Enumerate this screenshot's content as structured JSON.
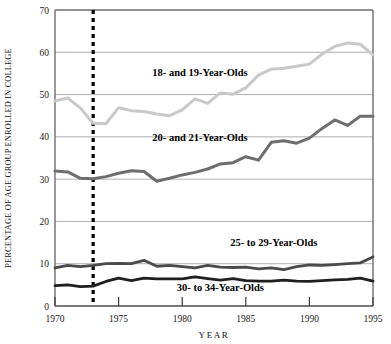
{
  "chart_data": {
    "type": "line",
    "title": "",
    "xlabel": "YEAR",
    "ylabel": "PERCENTAGE OF AGE GROUP ENROLLED IN COLLEGE",
    "xlim": [
      1970,
      1995
    ],
    "ylim": [
      0,
      70
    ],
    "xticks": [
      1970,
      1975,
      1980,
      1985,
      1990,
      1995
    ],
    "xtick_labels": [
      "1970",
      "1975",
      "1980",
      "1985",
      "1990",
      "1995"
    ],
    "yticks": [
      0,
      10,
      20,
      30,
      40,
      50,
      60,
      70
    ],
    "ytick_labels": [
      "0",
      "10",
      "20",
      "30",
      "40",
      "50",
      "60",
      "70"
    ],
    "grid": "horizontal",
    "legend_position": "inline-annotations",
    "annotations": [
      {
        "text": "18- and 19-Year-Olds",
        "x": 1981.4,
        "y": 54.5
      },
      {
        "text": "20- and 21-Year-Olds",
        "x": 1981.4,
        "y": 39.0
      },
      {
        "text": "25- to 29-Year-Olds",
        "x": 1987.2,
        "y": 14.2
      },
      {
        "text": "30- to 34-Year-Olds",
        "x": 1983.0,
        "y": 3.6
      }
    ],
    "marker_line": {
      "x": 1973,
      "style": "dashed",
      "color": "#000000"
    },
    "x": [
      1970,
      1971,
      1972,
      1973,
      1974,
      1975,
      1976,
      1977,
      1978,
      1979,
      1980,
      1981,
      1982,
      1983,
      1984,
      1985,
      1986,
      1987,
      1988,
      1989,
      1990,
      1991,
      1992,
      1993,
      1994,
      1995
    ],
    "series": [
      {
        "name": "18- and 19-Year-Olds",
        "color": "#c9c9c9",
        "values": [
          48.5,
          49.2,
          46.8,
          43.2,
          43.1,
          46.9,
          46.2,
          46.0,
          45.4,
          45.0,
          46.4,
          49.0,
          47.9,
          50.4,
          50.1,
          51.6,
          54.6,
          56.0,
          56.2,
          56.7,
          57.2,
          59.6,
          61.4,
          62.2,
          61.9,
          59.4
        ]
      },
      {
        "name": "20- and 21-Year-Olds",
        "color": "#6e6e6e",
        "values": [
          31.9,
          31.7,
          30.2,
          30.1,
          30.6,
          31.4,
          32.0,
          31.8,
          29.5,
          30.2,
          31.0,
          31.6,
          32.4,
          33.6,
          33.9,
          35.3,
          34.5,
          38.7,
          39.1,
          38.5,
          39.7,
          42.0,
          44.0,
          42.7,
          44.9,
          44.9
        ]
      },
      {
        "name": "25- to 29-Year-Olds",
        "color": "#4a4a4a",
        "values": [
          9.0,
          9.6,
          9.3,
          9.6,
          10.0,
          10.1,
          10.0,
          10.8,
          9.4,
          9.6,
          9.3,
          9.0,
          9.6,
          9.2,
          9.1,
          9.2,
          8.8,
          9.0,
          8.6,
          9.3,
          9.7,
          9.6,
          9.8,
          10.0,
          10.2,
          11.6
        ]
      },
      {
        "name": "30- to 34-Year-Olds",
        "color": "#1f1f1f",
        "values": [
          4.8,
          5.0,
          4.6,
          4.7,
          5.8,
          6.6,
          6.0,
          6.6,
          6.4,
          6.4,
          6.4,
          6.9,
          6.5,
          6.1,
          6.5,
          6.0,
          5.9,
          5.9,
          6.1,
          5.9,
          5.8,
          6.0,
          6.2,
          6.3,
          6.6,
          5.9
        ]
      }
    ]
  }
}
